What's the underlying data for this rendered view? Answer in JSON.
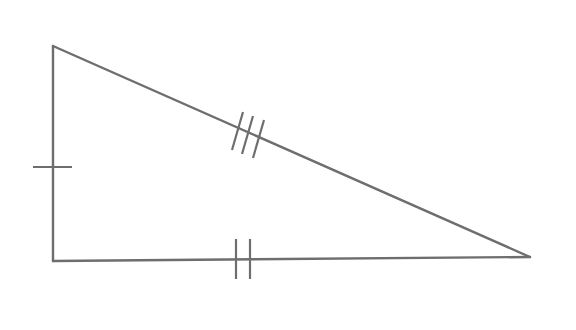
{
  "diagram": {
    "type": "right-triangle-congruence-marks",
    "background": "#ffffff",
    "stroke_color": "#6e6e6e",
    "vertices": {
      "top_left": [
        53,
        46
      ],
      "bottom_left": [
        53,
        261
      ],
      "right": [
        530,
        257
      ]
    },
    "sides": [
      {
        "name": "left-side",
        "from": "top_left",
        "to": "bottom_left",
        "tick_marks": 1
      },
      {
        "name": "bottom-side",
        "from": "bottom_left",
        "to": "right",
        "tick_marks": 2
      },
      {
        "name": "hypotenuse",
        "from": "top_left",
        "to": "right",
        "tick_marks": 3
      }
    ]
  }
}
